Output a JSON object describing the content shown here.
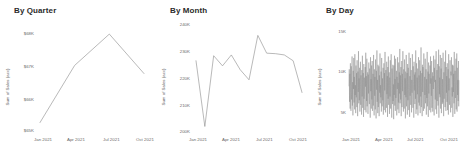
{
  "dashboard": {
    "background": "#ffffff",
    "line_color": "#8a8a8a",
    "text_color": "#6a6a6a",
    "title_color": "#2b2b2b"
  },
  "panels": [
    {
      "title": "By Quarter",
      "yaxis_title": "Sum of Sales (acc)",
      "yticks": [
        "$68K",
        "$67K",
        "$66K",
        "$65K"
      ],
      "xticks": [
        "Jan 2021",
        "Apr 2021",
        "Jul 2021",
        "Oct 2021"
      ]
    },
    {
      "title": "By Month",
      "yaxis_title": "Sum of Sales (acc)",
      "yticks": [
        "240K",
        "230K",
        "220K",
        "210K",
        "200K"
      ],
      "xticks": [
        "Jan 2021",
        "Apr 2021",
        "Jul 2021",
        "Oct 2021"
      ]
    },
    {
      "title": "By Day",
      "yaxis_title": "Sum of Sales (acc)",
      "yticks": [
        "15K",
        "10K",
        "5K"
      ],
      "xticks": [
        "Jan 2021",
        "Apr 2021",
        "Jul 2021",
        "Oct 2021"
      ]
    }
  ],
  "chart_data": [
    {
      "type": "line",
      "title": "By Quarter",
      "xlabel": "",
      "ylabel": "Sum of Sales (acc)",
      "grid": false,
      "legend": "none",
      "ylim": [
        65000,
        68600
      ],
      "ytick_values": [
        68000,
        67000,
        66000,
        65000
      ],
      "ytick_labels": [
        "$68K",
        "$67K",
        "$66K",
        "$65K"
      ],
      "x": [
        "Jan 2021",
        "Apr 2021",
        "Jul 2021",
        "Oct 2021"
      ],
      "values": [
        65200,
        67300,
        68450,
        67000
      ]
    },
    {
      "type": "line",
      "title": "By Month",
      "xlabel": "",
      "ylabel": "Sum of Sales (acc)",
      "grid": false,
      "legend": "none",
      "ylim": [
        200000,
        241000
      ],
      "ytick_values": [
        240000,
        230000,
        220000,
        210000,
        200000
      ],
      "ytick_labels": [
        "240K",
        "230K",
        "220K",
        "210K",
        "200K"
      ],
      "x": [
        "Jan 2021",
        "Feb 2021",
        "Mar 2021",
        "Apr 2021",
        "May 2021",
        "Jun 2021",
        "Jul 2021",
        "Aug 2021",
        "Sep 2021",
        "Oct 2021",
        "Nov 2021",
        "Dec 2021",
        "Jan 2022"
      ],
      "values": [
        226500,
        200600,
        228500,
        224500,
        228800,
        223000,
        219000,
        236500,
        229500,
        229300,
        228800,
        226500,
        214000
      ]
    },
    {
      "type": "line",
      "title": "By Day",
      "xlabel": "",
      "ylabel": "Sum of Sales (acc)",
      "grid": false,
      "legend": "none",
      "ylim": [
        2500,
        16000
      ],
      "ytick_values": [
        15000,
        10000,
        5000
      ],
      "ytick_labels": [
        "15K",
        "10K",
        "5K"
      ],
      "x_range": [
        "Jan 2021",
        "Dec 2021"
      ],
      "note": "daily series, ~365 points, high-frequency oscillation between ~3K and ~15K",
      "values": [
        8200,
        10400,
        6100,
        9800,
        5200,
        11200,
        7300,
        4900,
        10800,
        6400,
        9100,
        12100,
        5600,
        8700,
        4300,
        10200,
        7800,
        11900,
        6000,
        9400,
        5100,
        12400,
        7000,
        8300,
        4600,
        10900,
        6700,
        9900,
        5400,
        11600,
        8000,
        4200,
        10100,
        7400,
        12800,
        5900,
        9200,
        6300,
        10600,
        4800,
        8900,
        11400,
        5700,
        9600,
        7100,
        4400,
        10300,
        6800,
        12200,
        5300,
        8600,
        9900,
        4100,
        11100,
        6500,
        9300,
        7600,
        5000,
        10700,
        8100,
        12600,
        4700,
        9500,
        6200,
        11800,
        5500,
        8400,
        10000,
        4500,
        9700,
        7200,
        11300,
        6600,
        5800,
        10500,
        8800,
        4000,
        12000,
        7500,
        9100,
        5200,
        10900,
        6400,
        11500,
        4900,
        8200,
        9800,
        5600,
        12300,
        7000,
        4300,
        10400,
        6900,
        9400,
        5100,
        11700,
        8500,
        3900,
        10200,
        7700,
        12900,
        6100,
        9000,
        4600,
        11000,
        5400,
        8700,
        10800,
        4200,
        9600,
        7300,
        12500,
        5900,
        8300,
        6700,
        10100,
        4800,
        11900,
        7900,
        5500,
        9200,
        6300,
        10600,
        4400,
        8000,
        11200,
        5000,
        9900,
        7600,
        12700,
        6000,
        4700,
        10300,
        8600,
        5300,
        11400,
        7100,
        9500,
        4100,
        10700,
        6500,
        12100,
        5700,
        8900,
        10000,
        4500,
        9300,
        6800,
        11600,
        5200,
        8100,
        12400,
        7400,
        4000,
        10500,
        9700,
        5800,
        11000,
        6200,
        8400,
        3800,
        10900,
        7000,
        12200,
        5600,
        9100,
        4900,
        11800,
        6600,
        8800,
        10200,
        4300,
        9400,
        7800,
        12000,
        5100,
        8600,
        6000,
        11300,
        4600,
        10000,
        7200,
        13100,
        5900,
        9600,
        6400,
        10700,
        4200,
        8300,
        11500,
        5400,
        9800,
        7500,
        12800,
        6100,
        4800,
        10400,
        8900,
        5200,
        11700,
        7000,
        9200,
        3900,
        10100,
        6700,
        12300,
        5500,
        8500,
        9900,
        4400,
        11100,
        6300,
        10600,
        7700,
        5000,
        12600,
        8200,
        4100,
        9500,
        6900,
        11900,
        5700,
        8700,
        10300,
        4700,
        9000,
        7300,
        12400,
        6200,
        5300,
        10800,
        8400,
        4000,
        11400,
        7600,
        9700,
        5800,
        10000,
        6500,
        12900,
        4500,
        8100,
        11200,
        5100,
        9300,
        7100,
        10500,
        4300,
        8800,
        12000,
        6000,
        9600,
        5600,
        11600,
        7900,
        4600,
        10200,
        6800,
        13300,
        5400,
        8300,
        9900,
        4200,
        11000,
        7400,
        10700,
        6100,
        4900,
        12500,
        8600,
        5200,
        9400,
        7000,
        11800,
        5900,
        8000,
        10400,
        4400,
        9100,
        6600,
        12700,
        5500,
        8900,
        10100,
        4100,
        11300,
        7200,
        9800,
        6300,
        5000,
        10900,
        8500,
        12100,
        4700,
        9200,
        6900,
        11500,
        5300,
        8200,
        10000,
        4800,
        9500,
        7800,
        12200,
        5700,
        4300,
        10600,
        8700,
        11700,
        6400,
        9000,
        5100,
        12800,
        7500,
        4500,
        10300,
        6200,
        9700,
        11100,
        5600,
        8400,
        13000,
        4000,
        10800,
        7100,
        9300,
        6700,
        12300,
        5200,
        8600,
        10500,
        4600,
        11900,
        7700,
        5800,
        9100,
        6000,
        12600,
        8300,
        4200,
        10000,
        6500,
        9900,
        11400,
        5400,
        8800,
        12900,
        4900,
        10700,
        7300,
        9500,
        6100,
        11200,
        5000,
        8100,
        10400,
        4400,
        12400,
        7600,
        9200,
        5700,
        8500,
        11600,
        6300,
        4700,
        10100,
        9600,
        12000,
        5300,
        8000,
        6800,
        11000,
        4100,
        10900,
        7400,
        9800,
        5900,
        12700,
        8700,
        4500,
        10200,
        6600,
        9400,
        11800,
        5100,
        8300,
        12500,
        4800,
        10600,
        7000,
        9000,
        6200,
        11500,
        5500,
        8900
      ]
    }
  ]
}
